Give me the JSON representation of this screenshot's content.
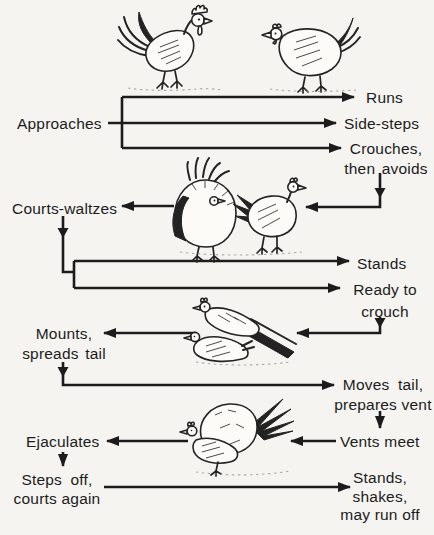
{
  "diagram": {
    "type": "courtship-behavior-flow",
    "left_column": {
      "approaches": "Approaches",
      "courts_waltzes": "Courts-waltzes",
      "mounts_line1": "Mounts,",
      "mounts_line2": "spreads tail",
      "ejaculates": "Ejaculates",
      "steps_off_line1": "Steps off,",
      "steps_off_line2": "courts again"
    },
    "right_column": {
      "runs": "Runs",
      "side_steps": "Side-steps",
      "crouches_line1": "Crouches,",
      "crouches_line2": "then avoids",
      "stands": "Stands",
      "ready_line1": "Ready to",
      "ready_line2": "crouch",
      "moves_tail_line1": "Moves tail,",
      "moves_tail_line2": "prepares vent",
      "vents_meet": "Vents meet",
      "final_line1": "Stands,",
      "final_line2": "shakes,",
      "final_line3": "may run off"
    },
    "illustrations": [
      {
        "name": "rooster-and-hen-standing"
      },
      {
        "name": "rooster-waltzing-and-hen"
      },
      {
        "name": "rooster-mounting-hen"
      },
      {
        "name": "rooster-hen-copulating"
      }
    ],
    "colors": {
      "background": "#f5f4f1",
      "ink": "#1c1c1c"
    }
  }
}
